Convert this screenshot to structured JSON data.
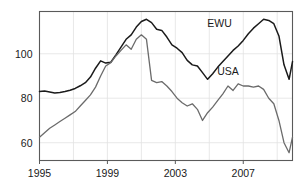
{
  "chart_data": {
    "type": "line",
    "title": "",
    "subtitle": "",
    "xlabel": "",
    "ylabel": "",
    "xlim": [
      1995.0,
      2009.9
    ],
    "ylim": [
      52.0,
      119.0
    ],
    "grid": true,
    "legend_position": "inline-annotation",
    "xticks": [
      1995,
      1999,
      2003,
      2007
    ],
    "xtick_labels": [
      "1995",
      "1999",
      "2003",
      "2007"
    ],
    "yticks": [
      60,
      80,
      100
    ],
    "ytick_labels": [
      "60",
      "80",
      "100"
    ],
    "annotations": [
      {
        "text": "EWU",
        "x": 2005.6,
        "y": 112.0
      },
      {
        "text": "USA",
        "x": 2006.1,
        "y": 90.5
      }
    ],
    "series": [
      {
        "name": "EWU",
        "color": "#1a1a1a",
        "linewidth": 1.5,
        "x": [
          1995.0,
          1995.3,
          1995.6,
          1995.9,
          1996.2,
          1996.5,
          1996.8,
          1997.1,
          1997.4,
          1997.7,
          1998.0,
          1998.3,
          1998.6,
          1998.9,
          1999.2,
          1999.5,
          1999.8,
          2000.1,
          2000.4,
          2000.7,
          2001.0,
          2001.3,
          2001.6,
          2001.9,
          2002.2,
          2002.5,
          2002.8,
          2003.1,
          2003.4,
          2003.7,
          2004.0,
          2004.3,
          2004.6,
          2004.9,
          2005.2,
          2005.5,
          2005.8,
          2006.1,
          2006.4,
          2006.7,
          2007.0,
          2007.3,
          2007.6,
          2007.9,
          2008.2,
          2008.5,
          2008.8,
          2009.1,
          2009.4,
          2009.7,
          2009.9
        ],
        "y": [
          83.0,
          83.2,
          82.8,
          82.4,
          82.6,
          83.0,
          83.6,
          84.4,
          85.6,
          87.0,
          89.5,
          93.5,
          96.8,
          95.8,
          96.2,
          99.5,
          103.0,
          106.5,
          108.5,
          112.0,
          114.5,
          115.5,
          114.0,
          111.0,
          110.5,
          107.5,
          104.0,
          102.5,
          100.5,
          97.0,
          95.0,
          94.5,
          91.5,
          88.5,
          91.0,
          94.0,
          96.5,
          99.0,
          101.5,
          103.5,
          106.0,
          109.0,
          111.5,
          113.5,
          115.5,
          115.0,
          113.5,
          108.0,
          95.0,
          88.5,
          96.5
        ]
      },
      {
        "name": "USA",
        "color": "#6b6b6b",
        "linewidth": 1.3,
        "x": [
          1995.0,
          1995.3,
          1995.6,
          1995.9,
          1996.2,
          1996.5,
          1996.8,
          1997.1,
          1997.4,
          1997.7,
          1998.0,
          1998.3,
          1998.6,
          1998.9,
          1999.2,
          1999.5,
          1999.8,
          2000.1,
          2000.4,
          2000.7,
          2001.0,
          2001.3,
          2001.6,
          2001.9,
          2002.2,
          2002.5,
          2002.8,
          2003.1,
          2003.4,
          2003.7,
          2004.0,
          2004.3,
          2004.6,
          2004.9,
          2005.2,
          2005.5,
          2005.8,
          2006.1,
          2006.4,
          2006.7,
          2007.0,
          2007.3,
          2007.6,
          2007.9,
          2008.2,
          2008.5,
          2008.8,
          2009.1,
          2009.4,
          2009.7,
          2009.9
        ],
        "y": [
          62.5,
          64.5,
          66.5,
          68.0,
          69.5,
          71.0,
          72.5,
          74.0,
          76.5,
          79.0,
          81.5,
          85.0,
          90.0,
          94.5,
          96.0,
          99.0,
          101.5,
          104.0,
          102.0,
          106.5,
          108.5,
          106.5,
          88.0,
          87.0,
          87.5,
          85.5,
          83.0,
          80.0,
          78.0,
          76.5,
          77.5,
          75.0,
          70.0,
          73.5,
          76.0,
          79.0,
          82.0,
          85.5,
          83.5,
          86.5,
          85.5,
          85.5,
          85.0,
          85.5,
          84.0,
          80.0,
          77.5,
          70.0,
          60.0,
          55.5,
          62.5
        ]
      }
    ]
  }
}
